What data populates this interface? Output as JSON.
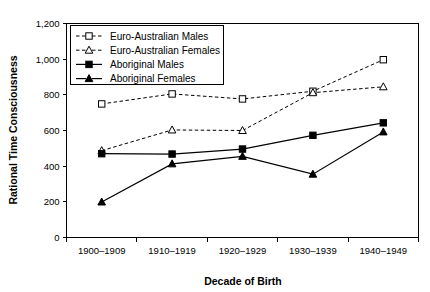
{
  "chart_data": {
    "type": "line",
    "title": "",
    "xlabel": "Decade of Birth",
    "ylabel": "Rational Time Consciousness",
    "categories": [
      "1900–1909",
      "1910–1919",
      "1920–1929",
      "1930–1939",
      "1940–1949"
    ],
    "ylim": [
      0,
      1200
    ],
    "yticks": [
      0,
      200,
      400,
      600,
      800,
      1000,
      1200
    ],
    "ytick_labels": [
      "0",
      "200",
      "400",
      "600",
      "800",
      "1,000",
      "1,200"
    ],
    "grid": false,
    "legend_position": "top-left-inside",
    "series": [
      {
        "name": "Euro-Australian Males",
        "marker": "open-square",
        "line_style": "dashed",
        "values": [
          749,
          805,
          777,
          820,
          997
        ]
      },
      {
        "name": "Euro-Australian Females",
        "marker": "open-triangle",
        "line_style": "dashed",
        "values": [
          487,
          603,
          600,
          812,
          845
        ]
      },
      {
        "name": "Aboriginal Males",
        "marker": "filled-square",
        "line_style": "solid",
        "values": [
          470,
          468,
          496,
          573,
          643
        ]
      },
      {
        "name": "Aboriginal Females",
        "marker": "filled-triangle",
        "line_style": "solid",
        "values": [
          199,
          413,
          455,
          355,
          592
        ]
      }
    ]
  },
  "axes": {
    "y_title": "Rational Time Consciousness",
    "x_title": "Decade of Birth"
  },
  "legend": {
    "entries": [
      {
        "label": "Euro-Australian Males"
      },
      {
        "label": "Euro-Australian Females"
      },
      {
        "label": "Aboriginal Males"
      },
      {
        "label": "Aboriginal Females"
      }
    ]
  }
}
